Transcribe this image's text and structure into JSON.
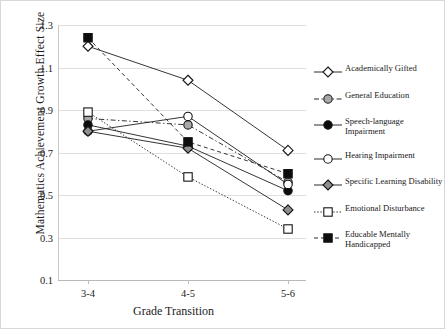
{
  "chart_data": {
    "type": "line",
    "title": "",
    "xlabel": "Grade Transition",
    "ylabel": "Mathematics Achievement  Growth Effect Size",
    "categories": [
      "3-4",
      "4-5",
      "5-6"
    ],
    "ylim": [
      0.1,
      1.3
    ],
    "yticks": [
      "0.1",
      "0.3",
      "0.5",
      "0.7",
      "0.9",
      "1.1",
      "1.3"
    ],
    "ytick_values": [
      0.1,
      0.3,
      0.5,
      0.7,
      0.9,
      1.1,
      1.3
    ],
    "grid": true,
    "legend_position": "right",
    "series": [
      {
        "name": "Academically Gifted",
        "marker": "open-diamond",
        "line": "solid",
        "color": "#2b2b2b",
        "values": [
          1.2,
          1.04,
          0.71
        ]
      },
      {
        "name": "General Education",
        "marker": "gray-circle",
        "line": "dash-dot",
        "color": "#9a9a9a",
        "values": [
          0.86,
          0.83,
          0.56
        ]
      },
      {
        "name": "Speech-language Impairment",
        "marker": "filled-circle",
        "line": "solid",
        "color": "#101010",
        "values": [
          0.83,
          0.73,
          0.52
        ]
      },
      {
        "name": "Hearing Impairment",
        "marker": "open-circle",
        "line": "solid",
        "color": "#3a3a3a",
        "values": [
          0.8,
          0.87,
          0.55
        ]
      },
      {
        "name": "Specific Learning Disability",
        "marker": "gray-diamond",
        "line": "solid",
        "color": "#7d7d7d",
        "values": [
          0.8,
          0.72,
          0.43
        ]
      },
      {
        "name": "Emotional Disturbance",
        "marker": "open-square",
        "line": "dotted",
        "color": "#4a4a4a",
        "values": [
          0.89,
          0.585,
          0.34
        ]
      },
      {
        "name": "Educable Mentally Handicapped",
        "marker": "filled-square",
        "line": "dashed",
        "color": "#111111",
        "values": [
          1.24,
          0.75,
          0.6
        ]
      }
    ]
  },
  "legend": {
    "items": [
      {
        "label": "Academically Gifted"
      },
      {
        "label": "General Education"
      },
      {
        "label": "Speech-language Impairment"
      },
      {
        "label": "Hearing Impairment"
      },
      {
        "label": "Specific Learning Disability"
      },
      {
        "label": "Emotional Disturbance"
      },
      {
        "label": "Educable Mentally Handicapped"
      }
    ]
  }
}
